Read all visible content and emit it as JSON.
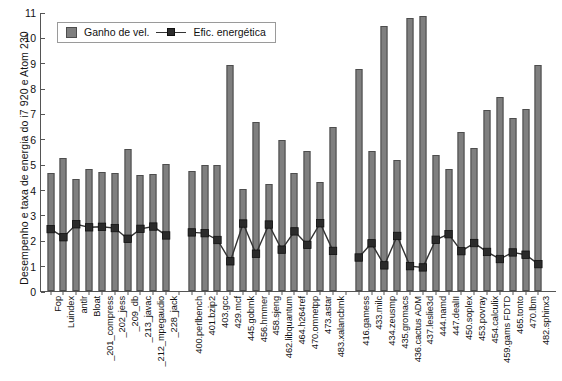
{
  "chart_data": {
    "type": "bar",
    "title": "",
    "xlabel": "",
    "ylabel": "Desempenho e taxa de energia do i7 920 e Atom 230",
    "ylim": [
      0,
      11
    ],
    "ytick_step": 1,
    "yticks": [
      "0",
      "1",
      "2",
      "3",
      "4",
      "5",
      "6",
      "7",
      "8",
      "9",
      "10",
      "11"
    ],
    "grid": false,
    "legend_position": "top-left",
    "legend": [
      "Ganho de vel.",
      "Efic. energética"
    ],
    "bar_color": "#7f7f7f",
    "bar_edge_color": "#4d4d4d",
    "line_color": "#333333",
    "marker_color": "#2b2b2b",
    "groups": [
      {
        "name": "group-1",
        "size": 10
      },
      {
        "name": "group-2",
        "size": 12
      },
      {
        "name": "group-3",
        "size": 17
      }
    ],
    "categories": [
      "Fop",
      "Luindex",
      "antlr",
      "Bloat",
      "_201_compress",
      "_202_jess",
      "_209_db",
      "_213_javac",
      "_212_mpegaudio",
      "_228_jack",
      "400.perlbench",
      "401.bzip2",
      "403.gcc",
      "429.mcf",
      "445.gobmk",
      "456.hmmer",
      "458.sjeng",
      "462.libquantum",
      "464.h264ref",
      "470.omnetpp",
      "473.astar",
      "483.xalancbmk",
      "416.gamess",
      "433.milc",
      "434.zeusmp",
      "435.gromacs",
      "436.cactus ADM",
      "437.leslie3d",
      "444.namd",
      "447.dealII",
      "450.soplex",
      "453.povray",
      "454.calculix",
      "459.gams FDTD",
      "465.tonto",
      "470.lbm",
      "482.sphinx3"
    ],
    "series": [
      {
        "name": "Ganho de vel.",
        "type": "bar",
        "values": [
          4.67,
          5.26,
          4.4,
          4.8,
          4.68,
          4.66,
          5.61,
          4.57,
          4.63,
          5.01,
          4.73,
          4.96,
          4.96,
          8.91,
          4.02,
          6.67,
          4.21,
          5.95,
          4.64,
          5.53,
          4.28,
          6.45,
          8.77,
          5.53,
          10.46,
          5.17,
          10.76,
          10.85,
          5.38,
          4.82,
          6.27,
          5.65,
          7.13,
          7.63,
          6.82,
          7.19,
          8.91
        ]
      },
      {
        "name": "Efic. energética",
        "type": "line",
        "values": [
          2.48,
          2.16,
          2.67,
          2.55,
          2.57,
          2.52,
          2.1,
          2.49,
          2.58,
          2.23,
          2.35,
          2.32,
          2.05,
          1.21,
          2.7,
          1.51,
          2.66,
          1.67,
          2.39,
          1.86,
          2.71,
          1.62,
          1.36,
          1.92,
          1.05,
          2.21,
          1.02,
          0.97,
          2.06,
          2.28,
          1.61,
          1.93,
          1.58,
          1.3,
          1.56,
          1.47,
          1.1
        ]
      }
    ]
  }
}
